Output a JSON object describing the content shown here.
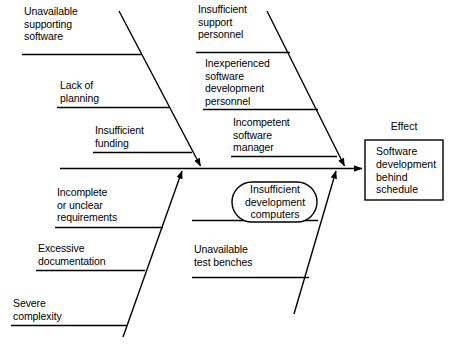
{
  "diagram": {
    "type": "fishbone-ishikawa",
    "colors": {
      "line": "#000000",
      "text": "#000000",
      "background": "#ffffff"
    },
    "effect": {
      "title": "Effect",
      "text": "Software\ndevelopment\nbehind\nschedule"
    },
    "causes": {
      "upper_left": [
        {
          "id": "unavailable-supporting-software",
          "text": "Unavailable\nsupporting\nsoftware"
        },
        {
          "id": "lack-of-planning",
          "text": "Lack of\nplanning"
        },
        {
          "id": "insufficient-funding",
          "text": "Insufficient\nfunding"
        }
      ],
      "upper_right": [
        {
          "id": "insufficient-support-personnel",
          "text": "Insufficient\nsupport\npersonnel"
        },
        {
          "id": "inexperienced-software-development-personnel",
          "text": "Inexperienced\nsoftware\ndevelopment\npersonnel"
        },
        {
          "id": "incompetent-software-manager",
          "text": "Incompetent\nsoftware\nmanager"
        }
      ],
      "lower_left": [
        {
          "id": "incomplete-or-unclear-requirements",
          "text": "Incomplete\nor unclear\nrequirements"
        },
        {
          "id": "excessive-documentation",
          "text": "Excessive\ndocumentation"
        },
        {
          "id": "severe-complexity",
          "text": "Severe\ncomplexity"
        }
      ],
      "lower_right": [
        {
          "id": "insufficient-development-computers",
          "text": "Insufficient\ndevelopment\ncomputers",
          "highlighted": true
        },
        {
          "id": "unavailable-test-benches",
          "text": "Unavailable\ntest benches"
        }
      ]
    }
  }
}
